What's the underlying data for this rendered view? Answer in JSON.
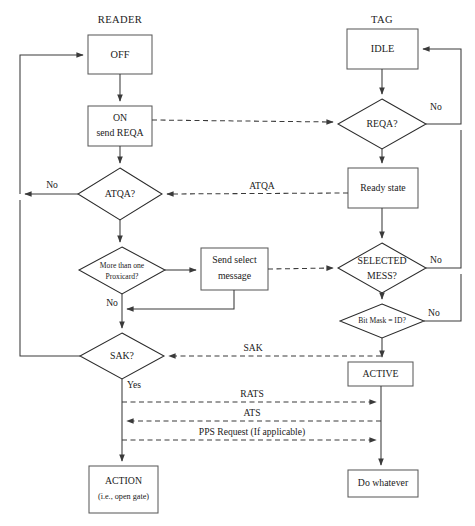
{
  "diagram": {
    "kind": "flowchart",
    "columns": [
      {
        "id": "reader",
        "title": "READER"
      },
      {
        "id": "tag",
        "title": "TAG"
      }
    ],
    "nodes": {
      "off": {
        "label": "OFF",
        "shape": "process"
      },
      "on_send_reqa_1": {
        "label": "ON",
        "shape": "process"
      },
      "on_send_reqa_2": {
        "label": "send REQA",
        "shape": "process"
      },
      "atqa_q": {
        "label": "ATQA?",
        "shape": "decision"
      },
      "more_than_one_1": {
        "label": "More than one",
        "shape": "decision"
      },
      "more_than_one_2": {
        "label": "Proxicard?",
        "shape": "decision"
      },
      "send_select_1": {
        "label": "Send select",
        "shape": "process"
      },
      "send_select_2": {
        "label": "message",
        "shape": "process"
      },
      "sak_q": {
        "label": "SAK?",
        "shape": "decision"
      },
      "action_1": {
        "label": "ACTION",
        "shape": "process"
      },
      "action_2": {
        "label": "(i.e., open gate)",
        "shape": "process"
      },
      "idle": {
        "label": "IDLE",
        "shape": "process"
      },
      "reqa_q": {
        "label": "REQA?",
        "shape": "decision"
      },
      "ready_state": {
        "label": "Ready state",
        "shape": "process"
      },
      "selected_1": {
        "label": "SELECTED",
        "shape": "decision"
      },
      "selected_2": {
        "label": "MESS?",
        "shape": "decision"
      },
      "bitmask_q": {
        "label": "Bit Mask = ID?",
        "shape": "decision"
      },
      "active": {
        "label": "ACTIVE",
        "shape": "process"
      },
      "do_whatever": {
        "label": "Do whatever",
        "shape": "process"
      }
    },
    "edge_labels": {
      "reqa_no": "No",
      "atqa_no": "No",
      "atqa_msg": "ATQA",
      "selected_no": "No",
      "proxicard_no": "No",
      "bitmask_no": "No",
      "sak_msg": "SAK",
      "sak_yes": "Yes",
      "rats": "RATS",
      "ats": "ATS",
      "pps": "PPS Request (If applicable)"
    },
    "colors": {
      "background": "#ffffff",
      "box_stroke": "#5c5c5c",
      "diamond_stroke": "#2b2b2b",
      "line": "#3a3a3a",
      "text": "#1a1a1a"
    }
  }
}
